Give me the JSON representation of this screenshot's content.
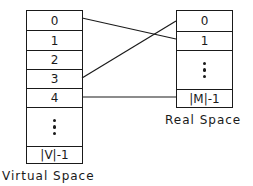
{
  "virtual_space": {
    "label": "Virtual Space",
    "cells": [
      "0",
      "1",
      "2",
      "3",
      "4",
      "ellipsis",
      "|V|-1"
    ]
  },
  "real_space": {
    "label": "Real Space",
    "cells": [
      "0",
      "1",
      "ellipsis",
      "|M|-1"
    ]
  },
  "mappings": [
    {
      "from": "virtual 0",
      "to": "real 1"
    },
    {
      "from": "virtual 3",
      "to": "real 0"
    },
    {
      "from": "virtual 4",
      "to": "real |M|-1"
    }
  ],
  "colors": {
    "line": "#1a1a1a",
    "background": "#ffffff"
  }
}
